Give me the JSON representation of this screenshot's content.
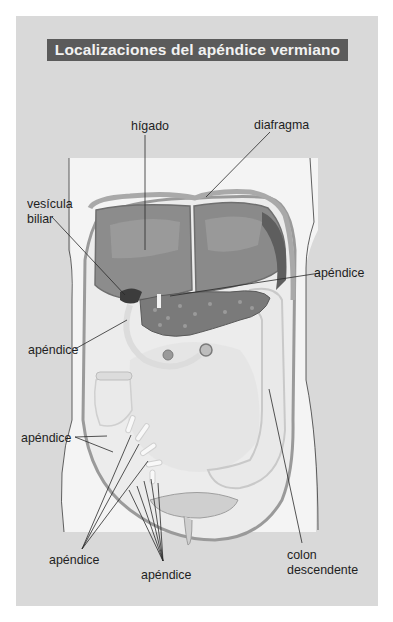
{
  "figure": {
    "title": "Localizaciones del apéndice vermiano",
    "colors": {
      "page_background": "#ffffff",
      "panel_background": "#d9d9d9",
      "title_bar": "#5b5b5b",
      "title_text": "#f2f2f2",
      "body_silhouette": "#f4f4f4",
      "liver": "#8c8c8c",
      "diaphragm": "#a9a9a9",
      "pancreas": "#7a7a7a",
      "intestine": "#e6e6e6",
      "leader_lines": "#2a2a2a"
    },
    "labels": {
      "liver": "hígado",
      "diaphragm": "diafragma",
      "gallbladder_line1": "vesícula",
      "gallbladder_line2": "biliar",
      "appendix_right_upper": "apéndice",
      "appendix_left_upper": "apéndice",
      "appendix_left_middle": "apéndice",
      "appendix_bottom_left": "apéndice",
      "appendix_bottom_center": "apéndice",
      "descending_colon_line1": "colon",
      "descending_colon_line2": "descendente"
    }
  }
}
